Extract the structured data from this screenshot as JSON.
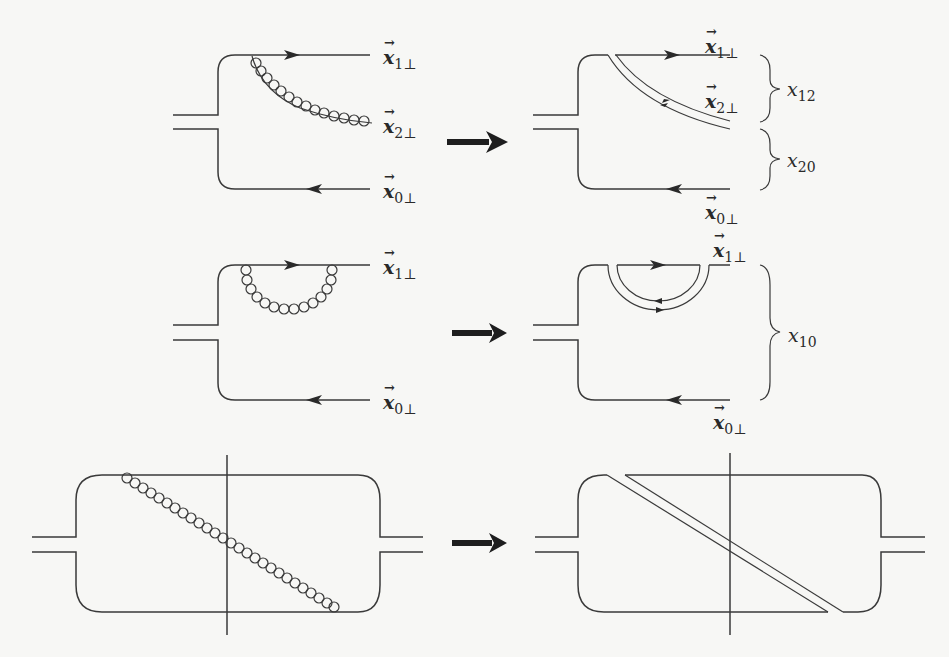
{
  "figure": {
    "transition_arrow": "right-arrow",
    "rows": [
      {
        "id": "row1",
        "left": {
          "type": "real gluon emission from quark line",
          "labels": {
            "x1": {
              "sym": "x",
              "sub": "1⊥"
            },
            "x2": {
              "sym": "x",
              "sub": "2⊥"
            },
            "x0": {
              "sym": "x",
              "sub": "0⊥"
            }
          }
        },
        "right": {
          "type": "double-line gluon splitting dipole",
          "labels": {
            "x1": {
              "sym": "x",
              "sub": "1⊥"
            },
            "x2": {
              "sym": "x",
              "sub": "2⊥"
            },
            "x0": {
              "sym": "x",
              "sub": "0⊥"
            }
          },
          "distances": [
            {
              "sym": "x",
              "sub": "12"
            },
            {
              "sym": "x",
              "sub": "20"
            }
          ]
        }
      },
      {
        "id": "row2",
        "left": {
          "type": "virtual gluon loop on quark line",
          "labels": {
            "x1": {
              "sym": "x",
              "sub": "1⊥"
            },
            "x0": {
              "sym": "x",
              "sub": "0⊥"
            }
          }
        },
        "right": {
          "type": "double-line virtual loop",
          "labels": {
            "x1": {
              "sym": "x",
              "sub": "1⊥"
            },
            "x0": {
              "sym": "x",
              "sub": "0⊥"
            }
          },
          "distances": [
            {
              "sym": "x",
              "sub": "10"
            }
          ]
        }
      },
      {
        "id": "row3",
        "left": {
          "type": "squared amplitude with gluon crossing cut line"
        },
        "right": {
          "type": "double-line representation crossing cut"
        }
      }
    ]
  }
}
